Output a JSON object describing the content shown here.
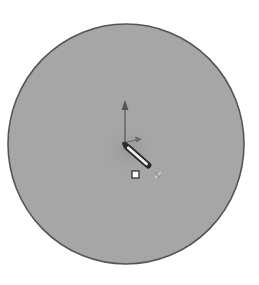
{
  "view": {
    "background": "#ffffff",
    "description": "Sketch canvas"
  },
  "sketch_circle": {
    "cx": 126,
    "cy": 144,
    "rx": 118,
    "ry": 120,
    "fill": "#a6a6a6",
    "stroke": "#555555",
    "center_shade": "#9a9a9a"
  },
  "origin": {
    "y_axis_arrow": {
      "x": 125,
      "y1": 143,
      "y2": 101,
      "color": "#555555"
    },
    "x_axis_arrow": {
      "x1": 127,
      "y1": 142,
      "x2": 141,
      "y2": 139,
      "color": "#666666"
    }
  },
  "pencil_cursor": {
    "x1": 125,
    "y1": 145,
    "x2": 150,
    "y2": 167,
    "icon": "pencil-icon"
  },
  "center_point": {
    "x": 135.5,
    "y": 174.5,
    "size": 7,
    "icon": "square-point-icon"
  },
  "snap_marker": {
    "x": 158,
    "y": 175,
    "icon": "x-marker-icon"
  }
}
